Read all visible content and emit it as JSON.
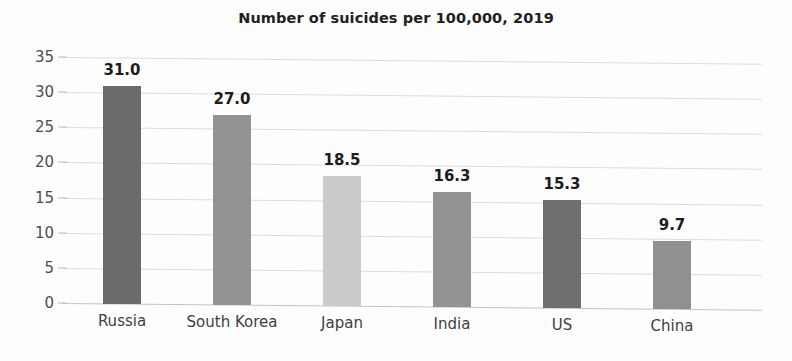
{
  "chart_data": {
    "type": "bar",
    "title": "Number of suicides per 100,000, 2019",
    "xlabel": "",
    "ylabel": "",
    "categories": [
      "Russia",
      "South Korea",
      "Japan",
      "India",
      "US",
      "China"
    ],
    "values": [
      31.0,
      27.0,
      18.5,
      16.3,
      15.3,
      9.7
    ],
    "value_labels": [
      "31.0",
      "27.0",
      "18.5",
      "16.3",
      "15.3",
      "9.7"
    ],
    "bar_colors": [
      "#6b6b6b",
      "#939393",
      "#cbcbcb",
      "#939393",
      "#6f6f6f",
      "#909090"
    ],
    "ylim": [
      0,
      35
    ],
    "yticks": [
      0,
      5,
      10,
      15,
      20,
      25,
      30,
      35
    ],
    "ytick_labels": [
      "0",
      "5",
      "10",
      "15",
      "20",
      "25",
      "30",
      "35"
    ],
    "grid": true,
    "grid_color": "#dcdcdc",
    "legend": false,
    "legend_position": "none",
    "background_color": "#fdfdfd",
    "title_color": "#231f20",
    "label_color": "#3f3f3f"
  }
}
